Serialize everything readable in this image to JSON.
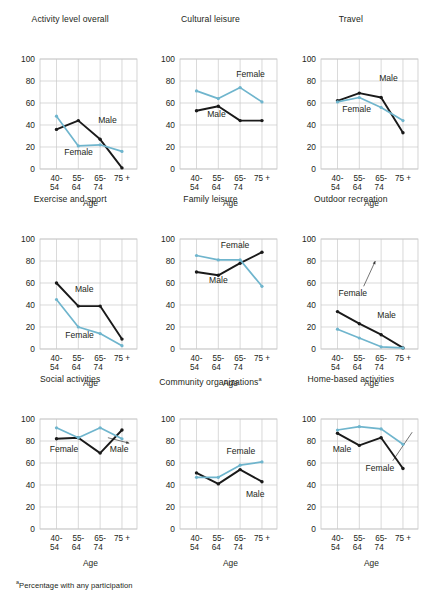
{
  "figure": {
    "footnote_marker": "a",
    "footnote_text": "Percentage with any participation",
    "xlabel": "Age",
    "series_labels": {
      "male": "Male",
      "female": "Female"
    },
    "colors": {
      "male": "#1a1a1a",
      "female": "#6fb5cd",
      "grid": "#c9c9c9",
      "text": "#231f20"
    },
    "x_categories": [
      "40-54",
      "55-64",
      "65-74",
      "75 +"
    ],
    "x_tick_line1": [
      "40-",
      "55-",
      "65-",
      "75 +"
    ],
    "x_tick_line2": [
      "54",
      "64",
      "74",
      ""
    ],
    "y_ticks": [
      "0",
      "20",
      "40",
      "60",
      "80",
      "100"
    ],
    "ylim": [
      0,
      100
    ]
  },
  "chart_data": [
    {
      "type": "line",
      "title": "Activity level overall",
      "xlabel": "Age",
      "ylabel": "",
      "ylim": [
        0,
        100
      ],
      "categories": [
        "40-54",
        "55-64",
        "65-74",
        "75 +"
      ],
      "grid": true,
      "legend": "inline-labels",
      "series": [
        {
          "name": "Male",
          "values": [
            36,
            44,
            27,
            1
          ],
          "label_x": 60,
          "label_y": 42
        },
        {
          "name": "Female",
          "values": [
            48,
            21,
            22,
            16
          ],
          "label_x": 25,
          "label_y": 13
        }
      ]
    },
    {
      "type": "line",
      "title": "Cultural leisure",
      "xlabel": "Age",
      "ylabel": "",
      "ylim": [
        0,
        100
      ],
      "categories": [
        "40-54",
        "55-64",
        "65-74",
        "75 +"
      ],
      "grid": true,
      "legend": "inline-labels",
      "series": [
        {
          "name": "Male",
          "values": [
            53,
            57,
            44,
            44
          ],
          "label_x": 28,
          "label_y": 47
        },
        {
          "name": "Female",
          "values": [
            71,
            64,
            74,
            61
          ],
          "label_x": 58,
          "label_y": 84
        }
      ]
    },
    {
      "type": "line",
      "title": "Travel",
      "xlabel": "Age",
      "ylabel": "",
      "ylim": [
        0,
        100
      ],
      "categories": [
        "40-54",
        "55-64",
        "65-74",
        "75 +"
      ],
      "grid": true,
      "legend": "inline-labels",
      "series": [
        {
          "name": "Male",
          "values": [
            62,
            69,
            65,
            33
          ],
          "label_x": 60,
          "label_y": 80
        },
        {
          "name": "Female",
          "values": [
            61,
            65,
            56,
            44
          ],
          "label_x": 22,
          "label_y": 52
        }
      ]
    },
    {
      "type": "line",
      "title": "Exercise and sport",
      "xlabel": "Age",
      "ylabel": "",
      "ylim": [
        0,
        100
      ],
      "categories": [
        "40-54",
        "55-64",
        "65-74",
        "75 +"
      ],
      "grid": true,
      "legend": "inline-labels",
      "series": [
        {
          "name": "Male",
          "values": [
            60,
            39,
            39,
            9
          ],
          "label_x": 36,
          "label_y": 52
        },
        {
          "name": "Female",
          "values": [
            45,
            20,
            14,
            3
          ],
          "label_x": 26,
          "label_y": 10
        }
      ]
    },
    {
      "type": "line",
      "title": "Family leisure",
      "xlabel": "Age",
      "ylabel": "",
      "ylim": [
        0,
        100
      ],
      "categories": [
        "40-54",
        "55-64",
        "65-74",
        "75 +"
      ],
      "grid": true,
      "legend": "inline-labels",
      "series": [
        {
          "name": "Male",
          "values": [
            70,
            67,
            78,
            88
          ],
          "label_x": 30,
          "label_y": 60
        },
        {
          "name": "Female",
          "values": [
            85,
            81,
            81,
            57
          ],
          "label_x": 42,
          "label_y": 92
        }
      ]
    },
    {
      "type": "line",
      "title": "Outdoor recreation",
      "xlabel": "Age",
      "ylabel": "",
      "ylim": [
        0,
        100
      ],
      "categories": [
        "40-54",
        "55-64",
        "65-74",
        "75 +"
      ],
      "grid": true,
      "legend": "inline-labels-with-leader",
      "series": [
        {
          "name": "Male",
          "values": [
            34,
            23,
            13,
            1
          ],
          "label_x": 58,
          "label_y": 28
        },
        {
          "name": "Female",
          "values": [
            18,
            10,
            2,
            1
          ],
          "label_x": 18,
          "label_y": 48
        }
      ]
    },
    {
      "type": "line",
      "title": "Social activities",
      "xlabel": "Age",
      "ylabel": "",
      "ylim": [
        0,
        100
      ],
      "categories": [
        "40-54",
        "55-64",
        "65-74",
        "75 +"
      ],
      "grid": true,
      "legend": "inline-labels-with-leader",
      "series": [
        {
          "name": "Male",
          "values": [
            82,
            83,
            69,
            90
          ],
          "label_x": 72,
          "label_y": 70
        },
        {
          "name": "Female",
          "values": [
            92,
            83,
            92,
            82
          ],
          "label_x": 10,
          "label_y": 70
        }
      ]
    },
    {
      "type": "line",
      "title": "Community organizations",
      "title_superscript": "a",
      "xlabel": "Age",
      "ylabel": "",
      "ylim": [
        0,
        100
      ],
      "categories": [
        "40-54",
        "55-64",
        "65-74",
        "75 +"
      ],
      "grid": true,
      "legend": "inline-labels",
      "series": [
        {
          "name": "Male",
          "values": [
            51,
            41,
            54,
            43
          ],
          "label_x": 68,
          "label_y": 29
        },
        {
          "name": "Female",
          "values": [
            47,
            47,
            58,
            61
          ],
          "label_x": 48,
          "label_y": 68
        }
      ]
    },
    {
      "type": "line",
      "title": "Home-based activities",
      "xlabel": "Age",
      "ylabel": "",
      "ylim": [
        0,
        100
      ],
      "categories": [
        "40-54",
        "55-64",
        "65-74",
        "75 +"
      ],
      "grid": true,
      "legend": "inline-labels-with-leader",
      "series": [
        {
          "name": "Male",
          "values": [
            87,
            76,
            83,
            55
          ],
          "label_x": 12,
          "label_y": 70
        },
        {
          "name": "Female",
          "values": [
            90,
            93,
            91,
            77
          ],
          "label_x": 46,
          "label_y": 53
        }
      ]
    }
  ]
}
